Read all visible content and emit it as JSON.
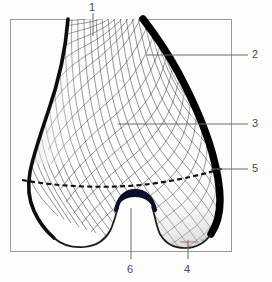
{
  "figure": {
    "kind": "anatomical-illustration",
    "view": "anterior",
    "frame": {
      "x": 10,
      "y": 19,
      "width": 222,
      "height": 233,
      "stroke": "#9a9a9a"
    },
    "background_color": "#fdfdfc",
    "ink_color": "#1a1a1a",
    "cortical_color": "#000000",
    "leader_color": "#6a6a6a",
    "label_color": "#4c4c4c",
    "accent_mark_color": "#c4706a",
    "signature": "f?. M"
  },
  "labels": [
    {
      "id": "1",
      "text": "1",
      "text_x": 89,
      "text_y": 2,
      "leader": {
        "x1": 93,
        "y1": 13,
        "x2": 93,
        "y2": 36
      },
      "anchor": "top"
    },
    {
      "id": "2",
      "text": "2",
      "text_x": 252,
      "text_y": 49,
      "leader": {
        "x1": 248,
        "y1": 55,
        "x2": 147,
        "y2": 55
      },
      "anchor": "right"
    },
    {
      "id": "3",
      "text": "3",
      "text_x": 252,
      "text_y": 118,
      "leader": {
        "x1": 248,
        "y1": 124,
        "x2": 118,
        "y2": 124
      },
      "anchor": "right"
    },
    {
      "id": "5",
      "text": "5",
      "text_x": 252,
      "text_y": 163,
      "leader": {
        "x1": 248,
        "y1": 169,
        "x2": 211,
        "y2": 169
      },
      "anchor": "right"
    },
    {
      "id": "6",
      "text": "6",
      "text_x": 127,
      "text_y": 264,
      "leader": {
        "x1": 131,
        "y1": 259,
        "x2": 131,
        "y2": 208
      },
      "anchor": "bottom"
    },
    {
      "id": "4",
      "text": "4",
      "text_x": 184,
      "text_y": 264,
      "leader": {
        "x1": 188,
        "y1": 259,
        "x2": 188,
        "y2": 240
      },
      "anchor": "bottom"
    }
  ],
  "features": {
    "epiphyseal_line": {
      "name": "epiphyseal line",
      "style": "dashed",
      "dash": "5 3",
      "width": 2.1
    },
    "intercondylar_notch": {
      "name": "intercondylar notch"
    },
    "medial_condyle": {
      "name": "medial condyle"
    },
    "lateral_condyle": {
      "name": "lateral condyle"
    },
    "shaft": {
      "name": "femoral shaft"
    },
    "trabeculae": {
      "name": "trabecular stress trajectories",
      "family_a_count": 26,
      "family_b_count": 24,
      "line_width": 0.55
    }
  }
}
